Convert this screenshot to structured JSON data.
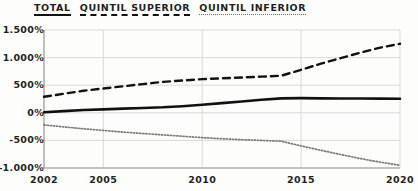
{
  "legend": {
    "entries": [
      {
        "label": "TOTAL",
        "style": "solid"
      },
      {
        "label": "QUINTIL SUPERIOR",
        "style": "dashed"
      },
      {
        "label": "QUINTIL INFERIOR",
        "style": "dotted"
      }
    ]
  },
  "axes": {
    "y_ticks": [
      "1.500%",
      "1.000%",
      "500%",
      "0%",
      "-500%",
      "-1.000%"
    ],
    "x_ticks": [
      "2002",
      "2005",
      "2010",
      "2015",
      "2020"
    ]
  },
  "chart_data": {
    "type": "line",
    "title": "",
    "subtitle": "",
    "xlabel": "",
    "ylabel": "",
    "xlim": [
      2002,
      2020
    ],
    "ylim": [
      -1000,
      1500
    ],
    "yunit": "%",
    "grid": true,
    "legend_position": "top-left",
    "x": [
      2002,
      2003,
      2004,
      2005,
      2006,
      2007,
      2008,
      2009,
      2010,
      2011,
      2012,
      2013,
      2014,
      2015,
      2016,
      2017,
      2018,
      2019,
      2020
    ],
    "y_tick_values": [
      1500,
      1000,
      500,
      0,
      -500,
      -1000
    ],
    "x_tick_values": [
      2002,
      2005,
      2010,
      2015,
      2020
    ],
    "series": [
      {
        "name": "TOTAL",
        "style": "solid",
        "color": "#111111",
        "width": 2.6,
        "values": [
          10,
          30,
          50,
          62,
          75,
          88,
          100,
          120,
          145,
          175,
          205,
          235,
          262,
          265,
          262,
          260,
          258,
          256,
          255
        ]
      },
      {
        "name": "QUINTIL SUPERIOR",
        "style": "dashed",
        "color": "#111111",
        "width": 2.4,
        "values": [
          290,
          345,
          400,
          440,
          480,
          520,
          560,
          585,
          610,
          625,
          640,
          655,
          672,
          780,
          890,
          990,
          1090,
          1180,
          1250
        ]
      },
      {
        "name": "QUINTIL INFERIOR",
        "style": "dotted",
        "color": "#7a7a7a",
        "width": 1.7,
        "values": [
          -220,
          -255,
          -290,
          -320,
          -350,
          -375,
          -400,
          -425,
          -450,
          -470,
          -487,
          -500,
          -515,
          -600,
          -680,
          -755,
          -830,
          -895,
          -950
        ]
      }
    ]
  }
}
